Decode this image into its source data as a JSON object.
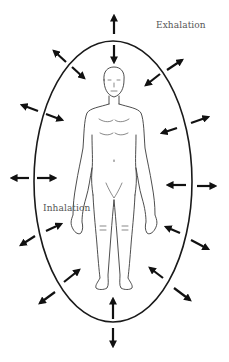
{
  "diagram": {
    "title": "",
    "labels": {
      "exhalation": "Exhalation",
      "inhalation": "Inhalation"
    },
    "colors": {
      "background": "#ffffff",
      "ellipse": "#1a1a1a",
      "arrows": "#111111",
      "figure": "#3a3a3a",
      "label_text": "#555555"
    },
    "aura_ellipse": {
      "cx": 113,
      "cy": 181.5,
      "rx": 79,
      "ry": 140.5
    },
    "arrow_pairs": [
      {
        "position": "top",
        "outward": "up",
        "inward": "down"
      },
      {
        "position": "top-left",
        "outward": "up-left",
        "inward": "down-right"
      },
      {
        "position": "top-right",
        "outward": "up-right",
        "inward": "down-left"
      },
      {
        "position": "upper-left",
        "outward": "left",
        "inward": "right"
      },
      {
        "position": "upper-right",
        "outward": "right",
        "inward": "left"
      },
      {
        "position": "middle-left",
        "outward": "left",
        "inward": "right"
      },
      {
        "position": "middle-right",
        "outward": "right",
        "inward": "left"
      },
      {
        "position": "lower-left",
        "outward": "down-left",
        "inward": "up-right"
      },
      {
        "position": "lower-right",
        "outward": "down-right",
        "inward": "up-left"
      },
      {
        "position": "bottom-left",
        "outward": "down-left",
        "inward": "up-right"
      },
      {
        "position": "bottom-right",
        "outward": "down-right",
        "inward": "up-left"
      },
      {
        "position": "bottom",
        "outward": "down",
        "inward": "up"
      }
    ],
    "figure": "human-body-front-view"
  }
}
